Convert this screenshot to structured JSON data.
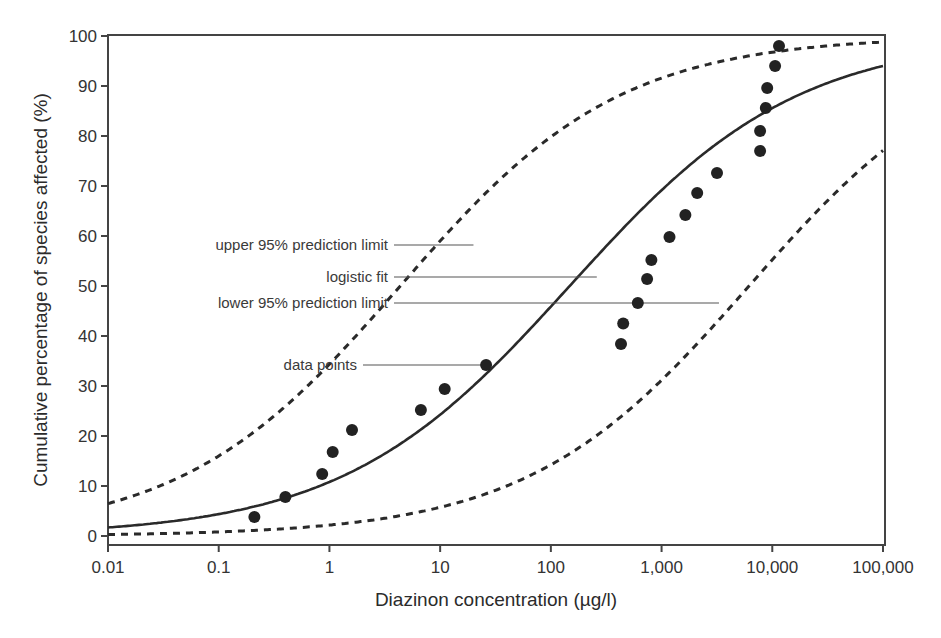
{
  "chart_data": {
    "type": "scatter",
    "title": "",
    "xlabel": "Diazinon concentration (µg/l)",
    "ylabel": "Cumulative percentage of species affected (%)",
    "xscale": "log",
    "xlim": [
      0.01,
      100000
    ],
    "ylim": [
      0,
      100
    ],
    "grid": false,
    "x_ticks": [
      0.01,
      0.1,
      1,
      10,
      100,
      1000,
      10000,
      100000
    ],
    "x_tick_labels": [
      "0.01",
      "0.1",
      "1",
      "10",
      "100",
      "1,000",
      "10,000",
      "100,000"
    ],
    "y_ticks": [
      0,
      10,
      20,
      30,
      40,
      50,
      60,
      70,
      80,
      90,
      100
    ],
    "y_tick_labels": [
      "0",
      "10",
      "20",
      "30",
      "40",
      "50",
      "60",
      "70",
      "80",
      "90",
      "100"
    ],
    "series": [
      {
        "name": "data points",
        "kind": "scatter",
        "x": [
          0.21,
          0.4,
          0.86,
          1.07,
          1.6,
          6.7,
          11,
          26,
          430,
          450,
          610,
          740,
          810,
          1180,
          1640,
          2100,
          3170,
          7760,
          7760,
          8730,
          9000,
          10600,
          11500
        ],
        "y": [
          3.8,
          7.8,
          12.4,
          16.8,
          21.2,
          25.2,
          29.4,
          34.2,
          38.4,
          42.5,
          46.6,
          51.4,
          55.2,
          59.8,
          64.2,
          68.6,
          72.6,
          77.0,
          81.0,
          85.6,
          89.6,
          94.0,
          98.0
        ]
      },
      {
        "name": "logistic fit",
        "kind": "line",
        "style": "solid",
        "log10_midpoint": 2.17,
        "log10_scale": 1.028
      },
      {
        "name": "upper 95% prediction limit",
        "kind": "line",
        "style": "dashed",
        "log10_midpoint": 0.64,
        "log10_scale": 0.989
      },
      {
        "name": "lower 95% prediction limit",
        "kind": "line",
        "style": "dashed",
        "log10_midpoint": 3.79,
        "log10_scale": 0.997
      }
    ],
    "annotations": [
      {
        "text": "upper 95% prediction limit",
        "label_y": 58.2,
        "line_to_x": 20
      },
      {
        "text": "logistic fit",
        "label_y": 51.8,
        "line_to_x": 260
      },
      {
        "text": "lower 95% prediction limit",
        "label_y": 46.6,
        "line_to_x": 3300
      },
      {
        "text": "data points",
        "label_y": 34.2,
        "line_to_x": 26
      }
    ],
    "colors": {
      "line": "#2a2a2a",
      "points": "#222222",
      "axis": "#444444",
      "leader": "#555555"
    }
  }
}
